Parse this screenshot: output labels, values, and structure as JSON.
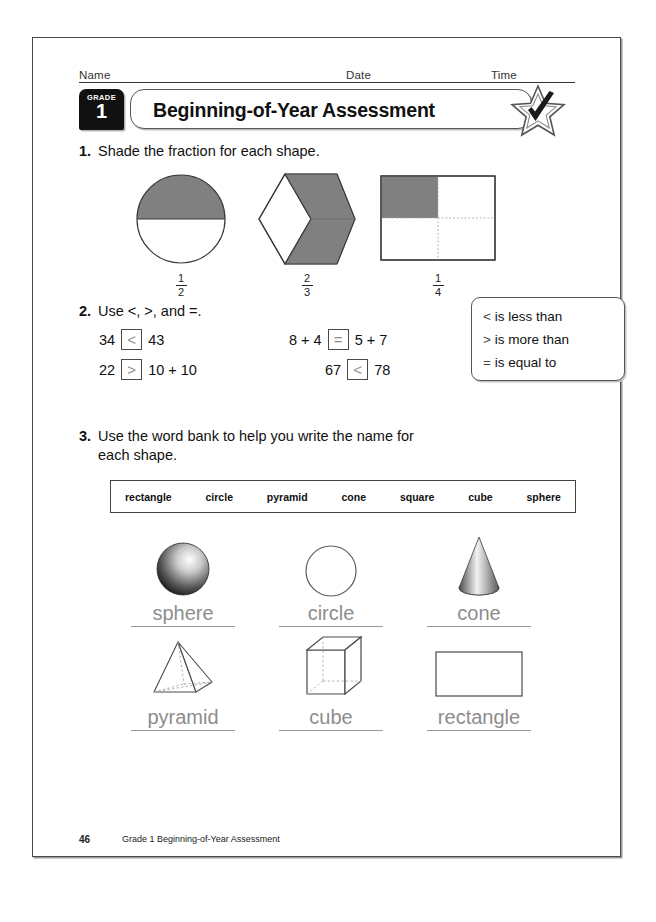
{
  "header": {
    "name_label": "Name",
    "date_label": "Date",
    "time_label": "Time",
    "grade_word": "GRADE",
    "grade_number": "1",
    "title": "Beginning-of-Year Assessment",
    "badge_icon": "star-check-icon"
  },
  "problem1": {
    "number": "1.",
    "text": "Shade the fraction for each shape.",
    "shapes": [
      {
        "name": "circle-half-shaded",
        "numerator": "1",
        "denominator": "2",
        "shaded_parts": 1,
        "total_parts": 2
      },
      {
        "name": "hexagon-thirds-shaded",
        "numerator": "2",
        "denominator": "3",
        "shaded_parts": 2,
        "total_parts": 3
      },
      {
        "name": "square-quarter-shaded",
        "numerator": "1",
        "denominator": "4",
        "shaded_parts": 1,
        "total_parts": 4
      }
    ]
  },
  "problem2": {
    "number": "2.",
    "text": "Use <, >, and =.",
    "equations": [
      {
        "left": "34",
        "answer": "<",
        "right": "43"
      },
      {
        "left": "8 + 4",
        "answer": "=",
        "right": "5 + 7"
      },
      {
        "left": "22",
        "answer": ">",
        "right": "10 + 10"
      },
      {
        "left": "67",
        "answer": "<",
        "right": "78"
      }
    ],
    "legend": [
      {
        "symbol": "<",
        "meaning": "is less than"
      },
      {
        "symbol": ">",
        "meaning": "is more than"
      },
      {
        "symbol": "=",
        "meaning": "is equal to"
      }
    ]
  },
  "problem3": {
    "number": "3.",
    "text_line1": "Use the word bank to help you write the name for",
    "text_line2": "each shape.",
    "word_bank": [
      "rectangle",
      "circle",
      "pyramid",
      "cone",
      "square",
      "cube",
      "sphere"
    ],
    "shapes": [
      {
        "icon": "sphere-icon",
        "answer": "sphere"
      },
      {
        "icon": "circle-icon",
        "answer": "circle"
      },
      {
        "icon": "cone-icon",
        "answer": "cone"
      },
      {
        "icon": "pyramid-icon",
        "answer": "pyramid"
      },
      {
        "icon": "cube-icon",
        "answer": "cube"
      },
      {
        "icon": "rectangle-icon",
        "answer": "rectangle"
      }
    ]
  },
  "footer": {
    "page_number": "46",
    "title": "Grade 1 Beginning-of-Year Assessment"
  },
  "colors": {
    "shading_gray": "#808080",
    "handwriting_gray": "#8d8d8d",
    "ink_black": "#111111",
    "rule_gray": "#4a4a4a"
  }
}
